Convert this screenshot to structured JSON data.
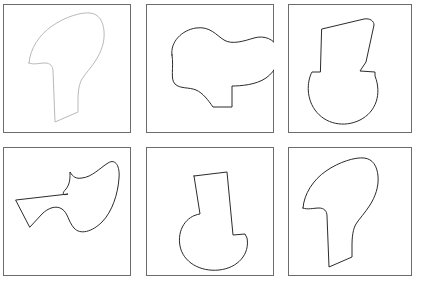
{
  "document": {
    "title": "Mental rotation shape panel sheet",
    "background_color": "#ffffff",
    "width": 422,
    "height": 285,
    "panel_count": 6,
    "rows": 2,
    "columns": 3
  },
  "frame": {
    "stroke_color": "#6c6c6c",
    "stroke_width": 1,
    "fill_color": "#ffffff"
  },
  "panels": [
    {
      "id": "panel-1",
      "position": "row1-col1",
      "index_label": "1",
      "box": {
        "x": 3,
        "y": 4,
        "width": 128,
        "height": 129
      },
      "shape": {
        "name": "boot-anvil-shape",
        "description": "rounded hook-like blob with downward tapering stem, upright orientation",
        "stroke_color": "#b9b9bd",
        "fill_color": "#ffffff",
        "stroke_width": 1,
        "rotation_deg": 0,
        "mirrored": false,
        "path": "M 29 63 C 30 49, 39 35, 52 26 C 65 17, 81 12, 90 13 C 99 14, 103 21, 104 31 C 105 42, 101 52, 96 60 C 91 68, 85 74, 82 79 C 79 84, 78 92, 78 100 L 78 112 L 55 122 L 53 71 C 53 66, 50 63, 45 63 C 40 63, 33 65, 29 63 Z"
      }
    },
    {
      "id": "panel-2",
      "position": "row1-col2",
      "index_label": "2",
      "box": {
        "x": 146,
        "y": 4,
        "width": 128,
        "height": 129
      },
      "shape": {
        "name": "blob-with-tab-shape",
        "description": "amoeba-like rounded blob with a small rectangular tab protruding at the bottom",
        "stroke_color": "#2b2b2b",
        "fill_color": "#ffffff",
        "stroke_width": 1,
        "rotation_deg": 0,
        "mirrored": false,
        "path": "M 172 55 C 170 42, 182 30, 196 28 C 210 26, 216 35, 224 40 C 232 45, 244 41, 254 38 C 264 35, 275 39, 278 49 C 281 59, 276 71, 266 78 C 256 85, 240 86, 232 86 L 232 107 L 213 107 C 208 100, 203 93, 196 90 C 189 87, 180 89, 175 84 C 170 79, 174 68, 172 55 Z"
      }
    },
    {
      "id": "panel-3",
      "position": "row1-col3",
      "index_label": "3",
      "box": {
        "x": 288,
        "y": 4,
        "width": 124,
        "height": 129
      },
      "shape": {
        "name": "spoon-j-shape",
        "description": "tall angled column rising from a rounded semicircular bowl, like a J or spoon",
        "stroke_color": "#2b2b2b",
        "fill_color": "#ffffff",
        "stroke_width": 1,
        "rotation_deg": 0,
        "mirrored": false,
        "path": "M 322 29 L 364 19 C 370 18, 374 21, 374 25 L 366 62 L 360 71 L 375 72 L 375 76 C 382 94, 376 112, 360 120 C 344 128, 325 124, 315 110 C 305 96, 308 79, 312 72 L 320 72 Z"
      }
    },
    {
      "id": "panel-4",
      "position": "row2-col1",
      "index_label": "4",
      "box": {
        "x": 3,
        "y": 147,
        "width": 128,
        "height": 129
      },
      "shape": {
        "name": "arrow-wing-shape",
        "description": "concave arrow / wing blob with a sharp left point and rounded right lobe",
        "stroke_color": "#2b2b2b",
        "fill_color": "#ffffff",
        "stroke_width": 1,
        "rotation_deg": 0,
        "mirrored": false,
        "path": "M 16 200 L 68 194 C 62 196, 62 193, 66 189 C 70 184, 70 178, 70 174 L 70 172 C 73 177, 76 179, 82 178 C 92 177, 100 168, 108 163 C 116 158, 120 167, 119 178 C 118 194, 112 212, 102 222 C 92 232, 80 235, 74 228 C 68 221, 68 213, 62 209 C 56 205, 48 208, 42 214 L 30 227 Z"
      }
    },
    {
      "id": "panel-5",
      "position": "row2-col2",
      "index_label": "5",
      "box": {
        "x": 146,
        "y": 147,
        "width": 128,
        "height": 129
      },
      "shape": {
        "name": "spoon-j-shape",
        "description": "same spoon/J shape as panel 3, rotated so the bowl sits at lower-left",
        "stroke_color": "#2b2b2b",
        "fill_color": "#ffffff",
        "stroke_width": 1,
        "rotation_deg": -18,
        "mirrored": false,
        "path": "M 194 176 L 227 172 L 233 235 L 245 234 L 247 238 C 250 254, 238 268, 219 270 C 200 272, 183 262, 180 246 C 177 230, 186 216, 200 214 L 194 176 Z"
      }
    },
    {
      "id": "panel-6",
      "position": "row2-col3",
      "index_label": "6",
      "box": {
        "x": 288,
        "y": 147,
        "width": 124,
        "height": 129
      },
      "shape": {
        "name": "boot-anvil-shape",
        "description": "same hook/boot shape as panel 1 but drawn in dark ink",
        "stroke_color": "#2b2b2b",
        "fill_color": "#ffffff",
        "stroke_width": 1,
        "rotation_deg": 0,
        "mirrored": false,
        "path": "M 303 208 C 304 194, 313 180, 326 171 C 339 162, 355 157, 364 158 C 373 159, 377 166, 378 176 C 379 187, 375 197, 370 205 C 365 213, 359 219, 356 224 C 353 229, 352 237, 352 245 L 352 257 L 329 267 L 327 216 C 327 211, 324 208, 319 208 C 314 208, 307 210, 303 208 Z"
      }
    }
  ],
  "legend": {
    "note": "Six bounded panels each containing one closed free-form outline figure"
  }
}
